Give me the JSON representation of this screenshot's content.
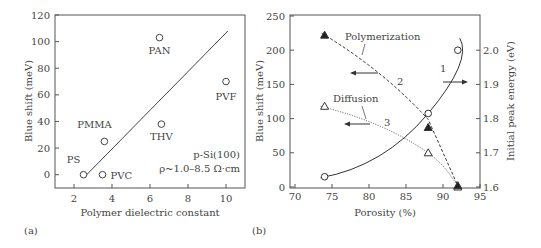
{
  "panel_labels": {
    "a": "(a)",
    "b": "(b)"
  },
  "chart_data": [
    {
      "id": "a",
      "type": "scatter",
      "title": "",
      "xlabel": "Polymer dielectric constant",
      "ylabel": "Blue shift (meV)",
      "xlim": [
        1,
        11
      ],
      "ylim": [
        -10,
        120
      ],
      "xticks": [
        2,
        4,
        6,
        8,
        10
      ],
      "yticks": [
        0,
        20,
        40,
        60,
        80,
        100,
        120
      ],
      "grid": false,
      "points": [
        {
          "label": "PS",
          "x": 2.5,
          "y": 0
        },
        {
          "label": "PVC",
          "x": 3.5,
          "y": 0
        },
        {
          "label": "PMMA",
          "x": 3.6,
          "y": 25
        },
        {
          "label": "PAN",
          "x": 6.5,
          "y": 103
        },
        {
          "label": "THV",
          "x": 6.6,
          "y": 38
        },
        {
          "label": "PVF",
          "x": 10.0,
          "y": 70
        }
      ],
      "fit_line": {
        "x": [
          2.6,
          10.1
        ],
        "y": [
          -1,
          108
        ]
      },
      "annotations": [
        "p-Si(100)",
        "ρ~1.0–8.5 Ω·cm"
      ]
    },
    {
      "id": "b",
      "type": "line",
      "title": "",
      "xlabel": "Porosity (%)",
      "ylabel": "Blue shift (meV)",
      "y2label": "Initial peak energy (eV)",
      "xlim": [
        70,
        95
      ],
      "ylim": [
        0,
        250
      ],
      "y2lim": [
        1.6,
        2.05
      ],
      "xticks": [
        70,
        75,
        80,
        85,
        90,
        95
      ],
      "yticks": [
        0,
        50,
        100,
        150,
        200,
        250
      ],
      "y2ticks": [
        1.6,
        1.7,
        1.8,
        1.9,
        2.0
      ],
      "grid": false,
      "series": [
        {
          "name": "1",
          "axis": "right",
          "marker": "open-circle",
          "style": "solid",
          "x": [
            74,
            88,
            92
          ],
          "y": [
            1.63,
            1.815,
            2.0
          ]
        },
        {
          "name": "2",
          "label": "Polymerization",
          "axis": "left",
          "marker": "filled-triangle",
          "style": "dashed",
          "x": [
            74,
            88,
            92
          ],
          "y": [
            222,
            87,
            2
          ]
        },
        {
          "name": "3",
          "label": "Diffusion",
          "axis": "left",
          "marker": "open-triangle",
          "style": "dotted",
          "x": [
            74,
            88,
            92
          ],
          "y": [
            118,
            50,
            0
          ]
        }
      ],
      "annotations": [
        "Polymerization",
        "Diffusion",
        "1",
        "2",
        "3"
      ]
    }
  ]
}
